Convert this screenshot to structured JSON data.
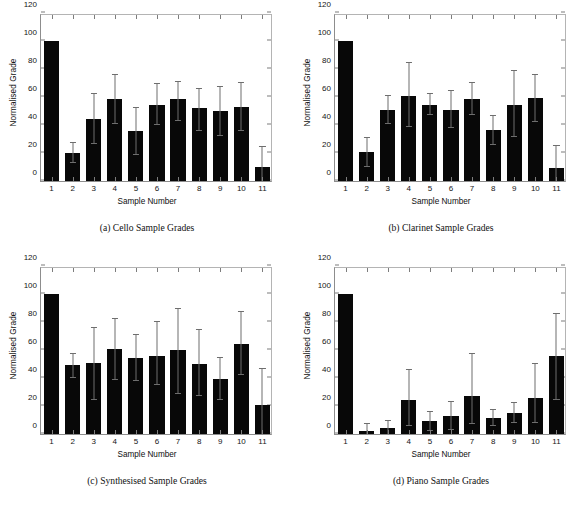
{
  "figure": {
    "axis": {
      "xlabel": "Sample Number",
      "ylabel": "Normalised Grade",
      "yticks": [
        0,
        20,
        40,
        60,
        80,
        100,
        120
      ],
      "ylim": [
        0,
        120
      ],
      "xticklabels": [
        "1",
        "2",
        "3",
        "4",
        "5",
        "6",
        "7",
        "8",
        "9",
        "10",
        "11"
      ]
    },
    "colors": {
      "bar": "#080808",
      "errorbar": "#6e6e6e",
      "axis": "#8d8d8d",
      "background": "#ffffff",
      "text": "#111111"
    },
    "panels": [
      {
        "key": "cello",
        "caption": "(a) Cello Sample Grades"
      },
      {
        "key": "clarinet",
        "caption": "(b) Clarinet Sample Grades"
      },
      {
        "key": "synthesised",
        "caption": "(c) Synthesised Sample Grades"
      },
      {
        "key": "piano",
        "caption": "(d) Piano Sample Grades"
      }
    ]
  },
  "chart_data": [
    {
      "type": "bar",
      "title": "(a) Cello Sample Grades",
      "xlabel": "Sample Number",
      "ylabel": "Normalised Grade",
      "ylim": [
        0,
        120
      ],
      "yticks": [
        0,
        20,
        40,
        60,
        80,
        100,
        120
      ],
      "grid": false,
      "legend": "none",
      "categories": [
        "1",
        "2",
        "3",
        "4",
        "5",
        "6",
        "7",
        "8",
        "9",
        "10",
        "11"
      ],
      "values": [
        100,
        20,
        44.5,
        58.5,
        36,
        54,
        58.5,
        52.5,
        50,
        53,
        10
      ],
      "error_low": [
        100,
        13,
        26.5,
        41,
        18.5,
        40,
        43,
        35.5,
        32,
        36,
        0
      ],
      "error_high": [
        100,
        27,
        62,
        76,
        52.5,
        69,
        71,
        66,
        67.5,
        70,
        24.5
      ]
    },
    {
      "type": "bar",
      "title": "(b) Clarinet Sample Grades",
      "xlabel": "Sample Number",
      "ylabel": "Normalised Grade",
      "ylim": [
        0,
        120
      ],
      "yticks": [
        0,
        20,
        40,
        60,
        80,
        100,
        120
      ],
      "grid": false,
      "legend": "none",
      "categories": [
        "1",
        "2",
        "3",
        "4",
        "5",
        "6",
        "7",
        "8",
        "9",
        "10",
        "11"
      ],
      "values": [
        100,
        20.5,
        50.5,
        60.5,
        54.5,
        51,
        58.5,
        36.5,
        54.5,
        59,
        9
      ],
      "error_low": [
        100,
        10,
        40.5,
        38.5,
        47,
        38,
        47,
        26,
        31.5,
        42,
        0
      ],
      "error_high": [
        100,
        31,
        61,
        84.5,
        62,
        64.5,
        70,
        46.5,
        78.5,
        76,
        25
      ]
    },
    {
      "type": "bar",
      "title": "(c) Synthesised Sample Grades",
      "xlabel": "Sample Number",
      "ylabel": "Normalised Grade",
      "ylim": [
        0,
        120
      ],
      "yticks": [
        0,
        20,
        40,
        60,
        80,
        100,
        120
      ],
      "grid": false,
      "legend": "none",
      "categories": [
        "1",
        "2",
        "3",
        "4",
        "5",
        "6",
        "7",
        "8",
        "9",
        "10",
        "11"
      ],
      "values": [
        100,
        49,
        51,
        60.5,
        54,
        56,
        60,
        50,
        39.5,
        64.5,
        21
      ],
      "error_low": [
        100,
        40,
        24,
        38.5,
        38,
        35,
        28.5,
        27,
        24,
        42,
        0
      ],
      "error_high": [
        100,
        57.5,
        76,
        82,
        71,
        80,
        89.5,
        74.5,
        54.5,
        87,
        46.5
      ]
    },
    {
      "type": "bar",
      "title": "(d) Piano Sample Grades",
      "xlabel": "Sample Number",
      "ylabel": "Normalised Grade",
      "ylim": [
        0,
        120
      ],
      "yticks": [
        0,
        20,
        40,
        60,
        80,
        100,
        120
      ],
      "grid": false,
      "legend": "none",
      "categories": [
        "1",
        "2",
        "3",
        "4",
        "5",
        "6",
        "7",
        "8",
        "9",
        "10",
        "11"
      ],
      "values": [
        100,
        2,
        4,
        24.5,
        9,
        13,
        27.5,
        11.5,
        15,
        26,
        55.5
      ],
      "error_low": [
        100,
        0,
        0,
        6,
        2.5,
        3,
        7,
        6,
        8,
        8,
        24.5
      ],
      "error_high": [
        100,
        7,
        9.5,
        45.5,
        15.5,
        23,
        57,
        17.5,
        22,
        50,
        85.5
      ]
    }
  ]
}
